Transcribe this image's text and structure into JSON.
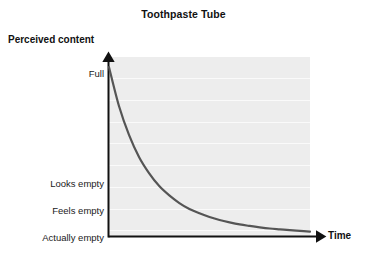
{
  "chart_data": {
    "type": "line",
    "title": "Toothpaste Tube",
    "xlabel": "Time",
    "ylabel": "Perceived content",
    "grid": true,
    "legend": false,
    "axis_style": "arrow",
    "ytick_labels": [
      "Full",
      "Looks empty",
      "Feels empty",
      "Actually empty"
    ],
    "ytick_values": [
      1.0,
      0.3,
      0.155,
      0.0
    ],
    "xtick_labels": [],
    "xlim": [
      0,
      1
    ],
    "ylim": [
      0,
      1.06
    ],
    "series": [
      {
        "name": "Perceived content over time",
        "color": "#555555",
        "linewidth": 2.2,
        "x": [
          0.0,
          0.05,
          0.1,
          0.15,
          0.2,
          0.25,
          0.3,
          0.35,
          0.4,
          0.45,
          0.5,
          0.55,
          0.6,
          0.65,
          0.7,
          0.75,
          0.8,
          0.85,
          0.9,
          0.95,
          1.0
        ],
        "values": [
          1.0,
          0.77,
          0.6,
          0.47,
          0.375,
          0.3,
          0.245,
          0.2,
          0.165,
          0.14,
          0.118,
          0.1,
          0.086,
          0.074,
          0.065,
          0.057,
          0.05,
          0.045,
          0.04,
          0.036,
          0.032
        ]
      }
    ],
    "gridline_count": 8,
    "colors": {
      "plot_background": "#ededed",
      "gridline": "#fafafa",
      "axis": "#111111",
      "curve": "#555555",
      "text": "#1a1a1a",
      "page_background": "#ffffff"
    }
  }
}
